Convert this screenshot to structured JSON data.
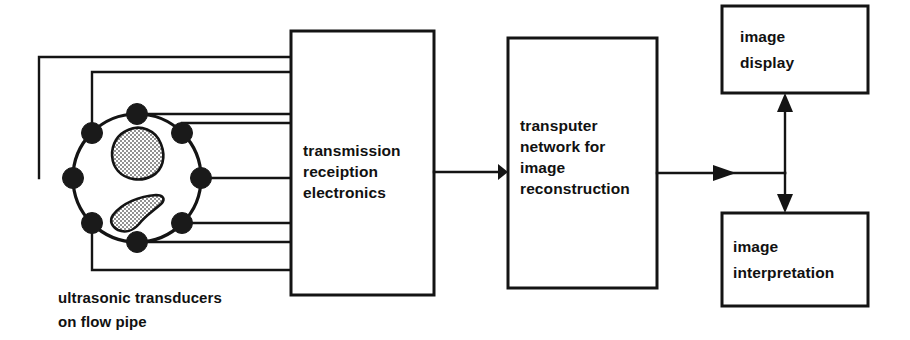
{
  "diagram": {
    "colors": {
      "ink": "#141414",
      "background": "#ffffff",
      "inclusion_fill": "#b9b9b9"
    },
    "blocks": [
      {
        "id": "transmission-reception-electronics",
        "lines": [
          "transmission",
          "receiption",
          "electronics"
        ],
        "x": 291,
        "y": 31,
        "width": 143,
        "height": 264
      },
      {
        "id": "transputer-network",
        "lines": [
          "transputer",
          "network for",
          "image",
          "reconstruction"
        ],
        "x": 508,
        "y": 38,
        "width": 149,
        "height": 250
      },
      {
        "id": "image-display",
        "lines": [
          "image",
          "display"
        ],
        "x": 722,
        "y": 6,
        "width": 146,
        "height": 87
      },
      {
        "id": "image-interpretation",
        "lines": [
          "image",
          "interpretation"
        ],
        "x": 722,
        "y": 213,
        "width": 146,
        "height": 93
      }
    ],
    "caption": {
      "id": "sensor-caption",
      "lines": [
        "ultrasonic transducers",
        "on flow pipe"
      ],
      "x": 58,
      "y": 300
    },
    "pipe": {
      "id": "flow-pipe",
      "center_x": 137,
      "center_y": 178,
      "radius": 64,
      "transducer_count": 8,
      "transducer_radius": 10,
      "transducer_angles_deg": [
        250,
        205,
        160,
        115,
        70,
        25,
        340,
        295
      ],
      "inclusions": [
        {
          "id": "inclusion-upper",
          "label": "flow inclusion"
        },
        {
          "id": "inclusion-lower",
          "label": "flow inclusion"
        }
      ]
    },
    "arrows": [
      {
        "id": "arrow-electronics-to-transputer",
        "from": "transmission-reception-electronics",
        "to": "transputer-network"
      },
      {
        "id": "arrow-transputer-to-branch",
        "from": "transputer-network",
        "to": "display-interpretation-branch"
      },
      {
        "id": "arrow-branch-to-display",
        "from": "display-interpretation-branch",
        "to": "image-display"
      },
      {
        "id": "arrow-branch-to-interpretation",
        "from": "display-interpretation-branch",
        "to": "image-interpretation"
      }
    ],
    "sensor_wires": 8
  }
}
